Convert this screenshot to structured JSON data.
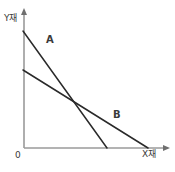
{
  "figure": {
    "background_color": "#ffffff",
    "axis_color": "#9a9a9a",
    "line_color": "#2a2a2a",
    "label_color": "#3a3a3a",
    "width": 175,
    "height": 172
  },
  "axes": {
    "y_label": "Y재",
    "x_label": "X재",
    "origin_label": "0",
    "y_axis": {
      "x": 24,
      "y_top": 12,
      "y_bottom": 148
    },
    "x_axis": {
      "y": 148,
      "x_left": 24,
      "x_right": 166
    },
    "y_arrow_tip": {
      "x": 24,
      "y": 8
    },
    "x_arrow_tip": {
      "x": 170,
      "y": 148
    }
  },
  "chart_data": {
    "type": "line",
    "title": "",
    "xlabel": "X재",
    "ylabel": "Y재",
    "grid": false,
    "legend": "inline-annotations",
    "series": [
      {
        "name": "A",
        "label": "A",
        "label_position": {
          "x": 46,
          "y": 35
        },
        "points": [
          {
            "x": 23,
            "y": 31
          },
          {
            "x": 107,
            "y": 148
          }
        ],
        "y_intercept_px": 31,
        "x_intercept_px": 107,
        "slope_desc": "steep"
      },
      {
        "name": "B",
        "label": "B",
        "label_position": {
          "x": 113,
          "y": 110
        },
        "points": [
          {
            "x": 23,
            "y": 70
          },
          {
            "x": 148,
            "y": 148
          }
        ],
        "y_intercept_px": 70,
        "x_intercept_px": 148,
        "slope_desc": "flat"
      }
    ],
    "intersection": {
      "x": 76,
      "y": 100
    }
  }
}
